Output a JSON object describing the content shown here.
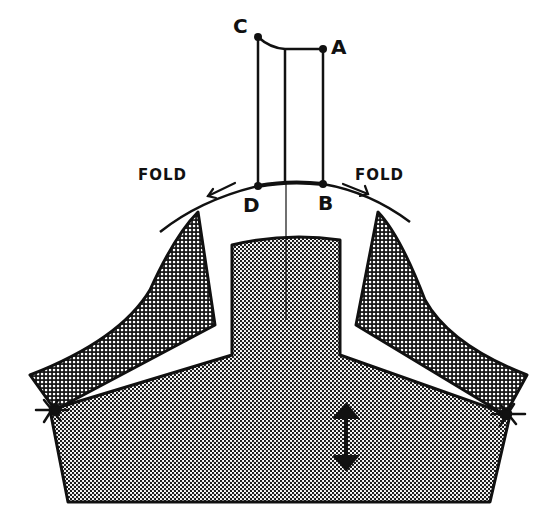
{
  "diagram": {
    "type": "sewing-pattern-draft",
    "labels": {
      "point_c": "C",
      "point_a": "A",
      "point_d": "D",
      "point_b": "B",
      "fold_left": "FOLD",
      "fold_right": "FOLD"
    },
    "colors": {
      "ink": "#111111",
      "paper": "#ffffff",
      "shade_dark": "#8a8a8a",
      "shade_light": "#b5b5b5"
    },
    "annotations": {
      "grainline": "double-headed vertical arrow",
      "fold_arrows": 2,
      "pivot_marks": 2
    }
  }
}
